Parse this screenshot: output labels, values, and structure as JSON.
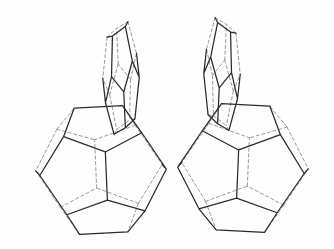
{
  "figure": {
    "background_color": "#fefefe",
    "visible_edge_color": "#2b2b2b",
    "hidden_edge_color": "#9a9a9a",
    "visible_edge_width": 1.25,
    "hidden_edge_width": 1,
    "hidden_edge_dash": "3.2 2.6",
    "width": 334,
    "height": 249,
    "cage_count": 4,
    "cage_labels": [
      "upper-left-dodecahedron",
      "upper-right-dodecahedron",
      "lower-left-dodecahedron",
      "lower-right-dodecahedron"
    ]
  },
  "chart_data": {
    "type": "diagram",
    "projection": "orthographic",
    "scale": 1.0,
    "cages": [
      {
        "name": "upper-left-dodecahedron",
        "center": [
          121,
          78
        ],
        "radius": 62,
        "orientation": "edge-on (narrow sliver at left)",
        "rot": [
          0.62,
          0.1,
          0.22
        ],
        "squash": 0.3
      },
      {
        "name": "upper-right-dodecahedron",
        "center": [
          222,
          74
        ],
        "radius": 62,
        "orientation": "edge-on (narrow sliver at right)",
        "rot": [
          0.62,
          -0.1,
          -0.22
        ],
        "squash": 0.3
      },
      {
        "name": "lower-left-dodecahedron",
        "center": [
          101,
          170
        ],
        "radius": 68,
        "orientation": "face-on (decagonal silhouette)",
        "rot": [
          0.1,
          0.08,
          0.05
        ],
        "squash": 1.0
      },
      {
        "name": "lower-right-dodecahedron",
        "center": [
          243,
          168
        ],
        "radius": 68,
        "orientation": "face-on (decagonal silhouette)",
        "rot": [
          0.1,
          -0.08,
          -0.05
        ],
        "squash": 1.0
      }
    ]
  }
}
